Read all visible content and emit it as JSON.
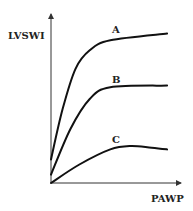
{
  "chart_data": {
    "type": "line",
    "title": "",
    "xlabel": "PAWP",
    "ylabel": "LVSWI",
    "xlim": [
      0,
      10
    ],
    "ylim": [
      0,
      10
    ],
    "grid": false,
    "ticks": false,
    "series": [
      {
        "name": "A",
        "x": [
          0,
          0.9,
          1.9,
          3.0,
          4.6,
          9.0
        ],
        "y": [
          1.4,
          4.4,
          6.8,
          7.9,
          8.5,
          8.9
        ]
      },
      {
        "name": "B",
        "x": [
          0,
          1.5,
          3.0,
          4.6,
          9.0
        ],
        "y": [
          0.5,
          3.2,
          5.0,
          5.7,
          5.8
        ]
      },
      {
        "name": "C",
        "x": [
          0,
          2.2,
          4.6,
          6.2,
          7.8,
          9.0
        ],
        "y": [
          0,
          1.1,
          2.0,
          2.2,
          2.1,
          2.0
        ]
      }
    ],
    "annotations": [
      {
        "text": "A",
        "series": "A"
      },
      {
        "text": "B",
        "series": "B"
      },
      {
        "text": "C",
        "series": "C"
      }
    ],
    "color": "#111111"
  }
}
